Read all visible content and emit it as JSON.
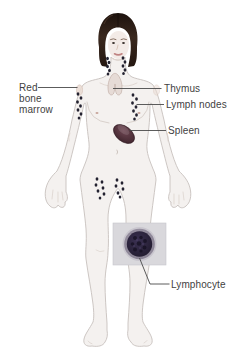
{
  "diagram": {
    "labels": {
      "red_bone_marrow": {
        "lines": [
          "Red",
          "bone",
          "marrow"
        ]
      },
      "thymus": "Thymus",
      "lymph_nodes": "Lymph nodes",
      "spleen": "Spleen",
      "lymphocyte": "Lymphocyte"
    },
    "colors": {
      "background": "#ffffff",
      "label_text": "#3f3f3f",
      "leader_line": "#4a4a4a",
      "skin": "#f4f1ef",
      "skin_outline": "#c7c1bd",
      "hair": "#30211b",
      "lymph_node": "#232230",
      "thymus_organ": "#e6dbd6",
      "spleen_organ": "#4b2d36",
      "inset_background": "#d9d8dc",
      "lymphocyte_cell": "#251e33",
      "lymphocyte_ring": "#948d9c"
    }
  }
}
